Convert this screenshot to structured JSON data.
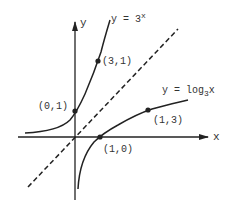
{
  "diagram": {
    "axes": {
      "x_label": "x",
      "y_label": "y"
    },
    "curves": [
      {
        "name": "exponential",
        "label_prefix": "y = 3",
        "label_sup": "x"
      },
      {
        "name": "logarithm",
        "label_prefix": "y = log",
        "label_sub": "3",
        "label_suffix": "x"
      }
    ],
    "reflection_line": "y = x (dashed)",
    "points": [
      {
        "label": "(0,1)",
        "curve": "exponential"
      },
      {
        "label": "(3,1)",
        "curve": "exponential"
      },
      {
        "label": "(1,0)",
        "curve": "logarithm"
      },
      {
        "label": "(1,3)",
        "curve": "logarithm"
      }
    ],
    "colors": {
      "ink": "#222222",
      "background": "#ffffff"
    }
  }
}
